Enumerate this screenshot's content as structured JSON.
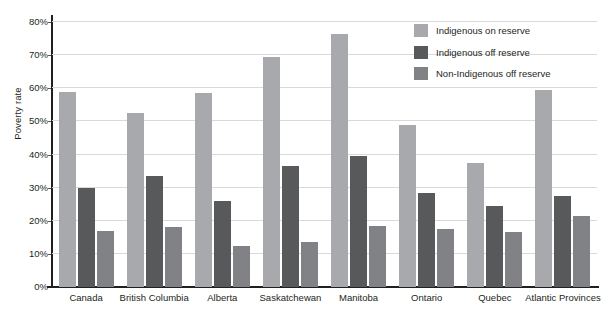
{
  "chart_data": {
    "type": "bar",
    "title": "",
    "xlabel": "",
    "ylabel": "Poverty rate",
    "ylim": [
      0,
      80
    ],
    "ytick_labels": [
      "0%",
      "10%",
      "20%",
      "30%",
      "40%",
      "50%",
      "60%",
      "70%",
      "80%"
    ],
    "ytick_values": [
      0,
      10,
      20,
      30,
      40,
      50,
      60,
      70,
      80
    ],
    "grid": true,
    "legend_position": "top-right",
    "categories": [
      "Canada",
      "British Columbia",
      "Alberta",
      "Saskatchewan",
      "Manitoba",
      "Ontario",
      "Quebec",
      "Atlantic Provinces"
    ],
    "series": [
      {
        "name": "Indigenous on reserve",
        "color": "#a7a9ac",
        "values": [
          59.0,
          52.5,
          58.5,
          69.5,
          76.5,
          48.8,
          37.5,
          59.5
        ]
      },
      {
        "name": "Indigenous off reserve",
        "color": "#58595b",
        "values": [
          30.0,
          33.5,
          26.0,
          36.5,
          39.5,
          28.5,
          24.5,
          27.5
        ]
      },
      {
        "name": "Non-Indigenous off reserve",
        "color": "#808285",
        "values": [
          17.0,
          18.0,
          12.5,
          13.5,
          18.5,
          17.5,
          16.5,
          21.5
        ]
      }
    ]
  },
  "colors": {
    "background": "#ffffff",
    "axis": "#231f20",
    "grid": "#d9d9d9",
    "text": "#231f20",
    "series_1": "#a7a9ac",
    "series_2": "#58595b",
    "series_3": "#808285"
  }
}
